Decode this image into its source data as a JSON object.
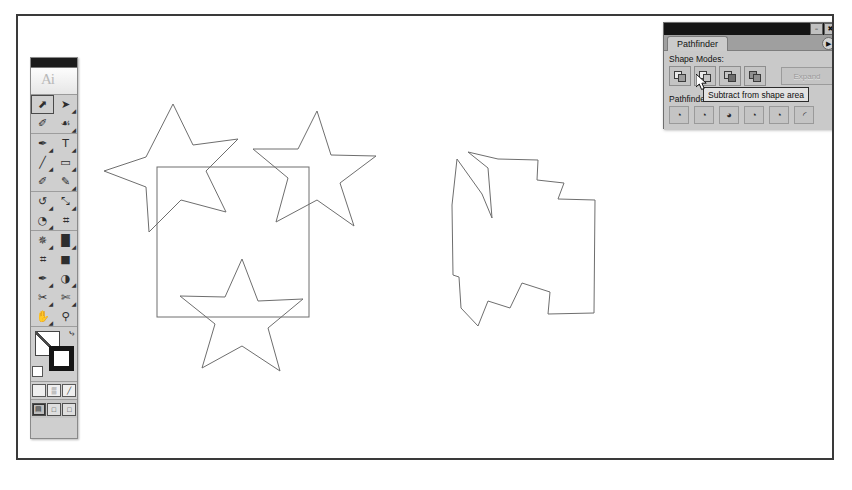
{
  "app": {
    "name": "Adobe Illustrator",
    "document_background": "#ffffff",
    "frame_color": "#3a3a3a"
  },
  "toolbox": {
    "name": "Tools",
    "logo_glyph": "Ai",
    "tools": [
      {
        "name": "selection-tool",
        "glyph": "⬈",
        "selected": true,
        "has_flyout": false
      },
      {
        "name": "direct-selection-tool",
        "glyph": "➤",
        "selected": false,
        "has_flyout": true
      },
      {
        "name": "magic-wand-tool",
        "glyph": "✐",
        "selected": false,
        "has_flyout": false
      },
      {
        "name": "lasso-tool",
        "glyph": "☙",
        "selected": false,
        "has_flyout": true
      },
      {
        "name": "pen-tool",
        "glyph": "✒",
        "selected": false,
        "has_flyout": true
      },
      {
        "name": "type-tool",
        "glyph": "T",
        "selected": false,
        "has_flyout": true
      },
      {
        "name": "line-segment-tool",
        "glyph": "╱",
        "selected": false,
        "has_flyout": true
      },
      {
        "name": "rectangle-tool",
        "glyph": "▭",
        "selected": false,
        "has_flyout": true
      },
      {
        "name": "paintbrush-tool",
        "glyph": "✐",
        "selected": false,
        "has_flyout": false
      },
      {
        "name": "pencil-tool",
        "glyph": "✎",
        "selected": false,
        "has_flyout": true
      },
      {
        "name": "rotate-tool",
        "glyph": "↺",
        "selected": false,
        "has_flyout": true
      },
      {
        "name": "scale-tool",
        "glyph": "⤡",
        "selected": false,
        "has_flyout": true
      },
      {
        "name": "warp-tool",
        "glyph": "◔",
        "selected": false,
        "has_flyout": true
      },
      {
        "name": "free-transform-tool",
        "glyph": "⌗",
        "selected": false,
        "has_flyout": false
      },
      {
        "name": "symbol-sprayer-tool",
        "glyph": "✵",
        "selected": false,
        "has_flyout": true
      },
      {
        "name": "column-graph-tool",
        "glyph": "█",
        "selected": false,
        "has_flyout": true
      },
      {
        "name": "mesh-tool",
        "glyph": "⌗",
        "selected": false,
        "has_flyout": false
      },
      {
        "name": "gradient-tool",
        "glyph": "■",
        "selected": false,
        "has_flyout": false
      },
      {
        "name": "eyedropper-tool",
        "glyph": "✒",
        "selected": false,
        "has_flyout": true
      },
      {
        "name": "blend-tool",
        "glyph": "◑",
        "selected": false,
        "has_flyout": true
      },
      {
        "name": "slice-tool",
        "glyph": "✂",
        "selected": false,
        "has_flyout": true
      },
      {
        "name": "scissors-tool",
        "glyph": "✄",
        "selected": false,
        "has_flyout": true
      },
      {
        "name": "hand-tool",
        "glyph": "✋",
        "selected": false,
        "has_flyout": true
      },
      {
        "name": "zoom-tool",
        "glyph": "⚲",
        "selected": false,
        "has_flyout": false
      }
    ],
    "fill_stroke": {
      "fill_label": "Fill",
      "fill_color": "#ffffff",
      "fill_is_none": true,
      "stroke_label": "Stroke",
      "stroke_color": "#151515",
      "swap_glyph": "⤷",
      "default_label": "Default Fill and Stroke"
    },
    "fill_modes": [
      {
        "name": "color-mode-button",
        "glyph": ""
      },
      {
        "name": "gradient-mode-button",
        "glyph": "▒"
      },
      {
        "name": "none-mode-button",
        "glyph": "╱"
      }
    ],
    "screen_modes": [
      {
        "name": "standard-screen-mode",
        "glyph": "▤",
        "active": true
      },
      {
        "name": "full-screen-mode-with-menu",
        "glyph": "□",
        "active": false
      },
      {
        "name": "full-screen-mode",
        "glyph": "□",
        "active": false
      }
    ]
  },
  "pathfinder_palette": {
    "title": "Pathfinder",
    "tab_label": "Pathfinder",
    "menu_glyph": "▶",
    "window_buttons": [
      {
        "name": "minimize-button",
        "glyph": "–"
      },
      {
        "name": "close-button",
        "glyph": "✖"
      }
    ],
    "shape_modes_label": "Shape Modes:",
    "shape_mode_buttons": [
      {
        "name": "add-to-shape-area-button",
        "tooltip": "Add to shape area"
      },
      {
        "name": "subtract-from-shape-area-button",
        "tooltip": "Subtract from shape area"
      },
      {
        "name": "intersect-shape-areas-button",
        "tooltip": "Intersect shape areas"
      },
      {
        "name": "exclude-overlapping-shape-areas-button",
        "tooltip": "Exclude overlapping shape areas"
      }
    ],
    "expand_label": "Expand",
    "expand_enabled": false,
    "pathfinders_label": "Pathfinders:",
    "pathfinder_buttons": [
      {
        "name": "divide-button",
        "glyph": "◔",
        "tooltip": "Divide"
      },
      {
        "name": "trim-button",
        "glyph": "◔",
        "tooltip": "Trim"
      },
      {
        "name": "merge-button",
        "glyph": "◕",
        "tooltip": "Merge"
      },
      {
        "name": "crop-button",
        "glyph": "◔",
        "tooltip": "Crop"
      },
      {
        "name": "outline-button",
        "glyph": "◔",
        "tooltip": "Outline"
      },
      {
        "name": "minus-back-button",
        "glyph": "◜",
        "tooltip": "Minus Back"
      }
    ]
  },
  "tooltip": {
    "text": "Subtract from shape area",
    "visible": true
  },
  "cursor": {
    "name": "arrow-pointer",
    "x": 694,
    "y": 72
  },
  "artwork": {
    "stroke_color": "#6e6e6e",
    "fill": "none",
    "description_left": "Three star shapes overlapping a square outline",
    "description_right": "Resulting compound shape after subtracting stars from square",
    "left_group": {
      "square": {
        "x": 155,
        "y": 165,
        "width": 152,
        "height": 150
      },
      "stars": [
        {
          "name": "star-top-left",
          "cx": 171,
          "cy": 163,
          "outer_r": 61,
          "inner_r": 27,
          "rotation": -18
        },
        {
          "name": "star-top-right",
          "cx": 305,
          "cy": 161,
          "outer_r": 61,
          "inner_r": 27,
          "rotation": 8
        },
        {
          "name": "star-bottom",
          "cx": 240,
          "cy": 313,
          "outer_r": 61,
          "inner_r": 27,
          "rotation": -6
        }
      ]
    },
    "right_group": {
      "result_shape_bbox": {
        "x": 440,
        "y": 157,
        "width": 145,
        "height": 157
      }
    }
  }
}
